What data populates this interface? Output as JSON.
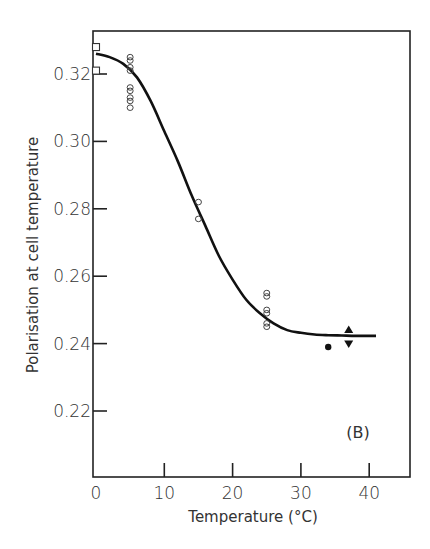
{
  "chart_data": {
    "type": "scatter",
    "title": "",
    "panel_label": "(B)",
    "xlabel": "Temperature (°C)",
    "ylabel": "Polarisation at cell temperature",
    "xlim": [
      0,
      46
    ],
    "ylim": [
      0.205,
      0.332
    ],
    "x_ticks": [
      0,
      10,
      20,
      30,
      40
    ],
    "x_tick_labels": [
      "0",
      "10",
      "20",
      "30",
      "40"
    ],
    "y_ticks": [
      0.22,
      0.24,
      0.26,
      0.28,
      0.3,
      0.32
    ],
    "y_tick_labels": [
      "0.22",
      "0.24",
      "0.26",
      "0.28",
      "0.30",
      "0.32"
    ],
    "grid": false,
    "legend": null,
    "series": [
      {
        "name": "open squares",
        "marker": "square-open",
        "points": [
          [
            0,
            0.328
          ],
          [
            0,
            0.321
          ]
        ]
      },
      {
        "name": "open circles",
        "marker": "circle-open",
        "points": [
          [
            5,
            0.325
          ],
          [
            5,
            0.324
          ],
          [
            5,
            0.322
          ],
          [
            5,
            0.321
          ],
          [
            5,
            0.316
          ],
          [
            5,
            0.315
          ],
          [
            5,
            0.313
          ],
          [
            5,
            0.312
          ],
          [
            5,
            0.31
          ],
          [
            15,
            0.282
          ],
          [
            15,
            0.277
          ],
          [
            25,
            0.255
          ],
          [
            25,
            0.254
          ],
          [
            25,
            0.25
          ],
          [
            25,
            0.249
          ],
          [
            25,
            0.246
          ],
          [
            25,
            0.245
          ]
        ]
      },
      {
        "name": "filled circle",
        "marker": "circle-filled",
        "points": [
          [
            34,
            0.239
          ]
        ]
      },
      {
        "name": "filled triangle up",
        "marker": "triangle-up",
        "points": [
          [
            37,
            0.244
          ]
        ]
      },
      {
        "name": "filled triangle down",
        "marker": "triangle-down",
        "points": [
          [
            37,
            0.24
          ]
        ]
      }
    ],
    "fit_curve": {
      "name": "sigmoid fit",
      "x": [
        0,
        2,
        4,
        6,
        8,
        10,
        12,
        14,
        16,
        18,
        20,
        22,
        24,
        26,
        28,
        30,
        32,
        34,
        36,
        38,
        40,
        41
      ],
      "y": [
        0.326,
        0.325,
        0.323,
        0.319,
        0.312,
        0.303,
        0.294,
        0.284,
        0.275,
        0.266,
        0.259,
        0.253,
        0.249,
        0.246,
        0.244,
        0.2432,
        0.2427,
        0.2425,
        0.2424,
        0.2423,
        0.2423,
        0.2423
      ]
    }
  }
}
